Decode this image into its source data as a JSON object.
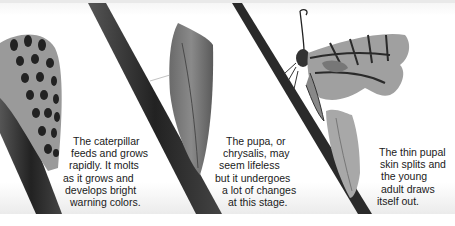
{
  "figure": {
    "stages": [
      {
        "name": "caterpillar",
        "caption_lines": [
          "The caterpillar",
          "feeds and grows",
          "rapidly. It molts",
          "as it grows and",
          "develops bright",
          "warning colors."
        ]
      },
      {
        "name": "pupa",
        "caption_lines": [
          "The pupa, or",
          "chrysalis, may",
          "seem lifeless",
          "but it undergoes",
          "a lot of changes",
          "at this stage."
        ]
      },
      {
        "name": "emerging-adult",
        "caption_lines": [
          "The thin pupal",
          "skin splits and",
          "the young",
          "adult draws",
          "itself out."
        ]
      }
    ]
  },
  "colors": {
    "background": "#ffffff",
    "stem": "#2b2b2b",
    "text": "#1a1a1a",
    "bottom_fade": "#ebebeb"
  }
}
